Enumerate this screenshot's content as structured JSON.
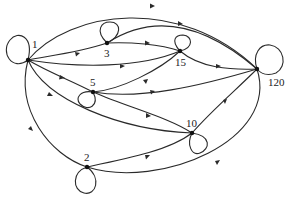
{
  "diagram": {
    "type": "directed-graph",
    "nodes": [
      {
        "id": "1",
        "label": "1",
        "x": 28,
        "y": 60
      },
      {
        "id": "3",
        "label": "3",
        "x": 107,
        "y": 43
      },
      {
        "id": "15",
        "label": "15",
        "x": 180,
        "y": 51
      },
      {
        "id": "5",
        "label": "5",
        "x": 93,
        "y": 92
      },
      {
        "id": "10",
        "label": "10",
        "x": 192,
        "y": 133
      },
      {
        "id": "2",
        "label": "2",
        "x": 87,
        "y": 167
      },
      {
        "id": "120",
        "label": "120",
        "x": 257,
        "y": 69
      }
    ],
    "edges": [
      {
        "from": "1",
        "to": "3"
      },
      {
        "from": "1",
        "to": "15"
      },
      {
        "from": "1",
        "to": "5"
      },
      {
        "from": "1",
        "to": "10"
      },
      {
        "from": "1",
        "to": "2"
      },
      {
        "from": "1",
        "to": "120"
      },
      {
        "from": "3",
        "to": "15"
      },
      {
        "from": "3",
        "to": "120"
      },
      {
        "from": "5",
        "to": "15"
      },
      {
        "from": "5",
        "to": "10"
      },
      {
        "from": "5",
        "to": "120"
      },
      {
        "from": "15",
        "to": "120"
      },
      {
        "from": "10",
        "to": "120"
      },
      {
        "from": "2",
        "to": "10"
      },
      {
        "from": "2",
        "to": "120"
      }
    ],
    "self_loops": [
      "1",
      "3",
      "15",
      "5",
      "10",
      "2",
      "120"
    ]
  }
}
